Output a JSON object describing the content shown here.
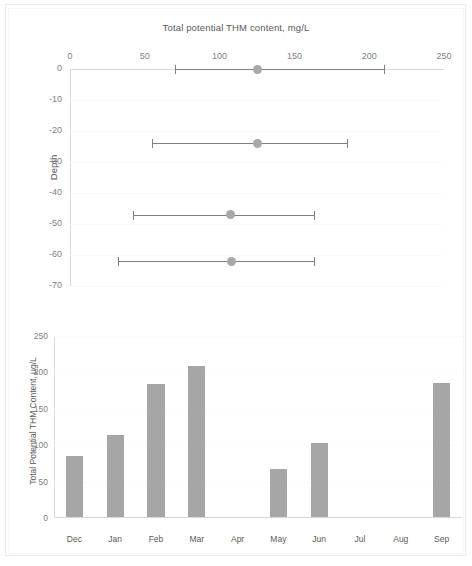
{
  "figure": {
    "background_color": "#ffffff",
    "series_color": "#a6a6a6",
    "line_color": "#808080",
    "axis_color": "#d9d9d9",
    "text_color": "#595959",
    "tick_color": "#7f7f7f"
  },
  "chart_data": [
    {
      "id": "top",
      "type": "scatter",
      "title": "Total potential THM content, mg/L",
      "xlabel": "Total potential THM content, mg/L",
      "ylabel": "Depth",
      "xlim": [
        0,
        250
      ],
      "ylim": [
        -70,
        0
      ],
      "grid": true,
      "legend": "none",
      "x_ticks": [
        "0",
        "50",
        "100",
        "150",
        "200",
        "250"
      ],
      "x_tick_values": [
        0,
        50,
        100,
        150,
        200,
        250
      ],
      "y_ticks": [
        "0",
        "-10",
        "-20",
        "-30",
        "-40",
        "-50",
        "-60",
        "-70"
      ],
      "y_tick_values": [
        0,
        -10,
        -20,
        -30,
        -40,
        -50,
        -60,
        -70
      ],
      "points": [
        {
          "depth": 0,
          "mean": 125,
          "low": 70,
          "high": 210
        },
        {
          "depth": -24,
          "mean": 125,
          "low": 55,
          "high": 185
        },
        {
          "depth": -47,
          "mean": 107,
          "low": 42,
          "high": 163
        },
        {
          "depth": -62,
          "mean": 108,
          "low": 32,
          "high": 163
        }
      ]
    },
    {
      "id": "bottom",
      "type": "bar",
      "title": "",
      "xlabel": "",
      "ylabel": "Total Potential THM Content, µg/L",
      "ylim": [
        0,
        250
      ],
      "grid": true,
      "legend": "none",
      "y_ticks": [
        "0",
        "50",
        "100",
        "150",
        "200",
        "250"
      ],
      "y_tick_values": [
        0,
        50,
        100,
        150,
        200,
        250
      ],
      "categories": [
        "Dec",
        "Jan",
        "Feb",
        "Mar",
        "Apr",
        "May",
        "Jun",
        "Jul",
        "Aug",
        "Sep"
      ],
      "values": [
        84,
        113,
        183,
        208,
        0,
        66,
        101,
        0,
        0,
        184
      ]
    }
  ]
}
